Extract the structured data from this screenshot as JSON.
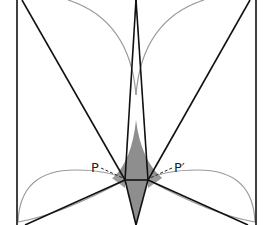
{
  "diagram": {
    "labels": {
      "p": "P",
      "p_prime": "P′"
    },
    "colors": {
      "line": "#111111",
      "arc": "#9a9a9a",
      "shade": "#8e8e8e",
      "background": "#ffffff"
    },
    "points": {
      "top_apex": [
        136,
        0
      ],
      "bottom_apex": [
        136,
        225
      ],
      "P": [
        125,
        180
      ],
      "P_prime": [
        148,
        180
      ]
    }
  }
}
